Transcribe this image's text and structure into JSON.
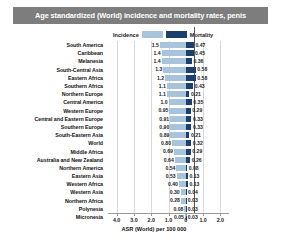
{
  "title": "Age standardized (World) incidence and mortality rates, penis",
  "legend": {
    "incidence_label": "Incidence",
    "mortality_label": "Mortality",
    "incidence_color": "#a8c4dd",
    "mortality_color": "#1c3f6e",
    "position": "top-center"
  },
  "axis": {
    "title": "ASR (World) per 100 000",
    "ticks": [
      "4.0",
      "3.0",
      "2.0",
      "1.0",
      "0",
      "1.0",
      "2.0"
    ],
    "tick_values": [
      -4.0,
      -3.0,
      -2.0,
      -1.0,
      0,
      1.0,
      2.0
    ]
  },
  "chart_data": {
    "type": "bar",
    "orientation": "horizontal-diverging",
    "title": "Age standardized (World) incidence and mortality rates, penis",
    "xlabel": "ASR (World) per 100 000",
    "ylabel": "",
    "xlim": [
      -4.5,
      2.5
    ],
    "grid": true,
    "legend_position": "top-center",
    "categories": [
      "South America",
      "Caribbean",
      "Melanesia",
      "South-Central Asia",
      "Eastern Africa",
      "Southern Africa",
      "Northern Europe",
      "Central America",
      "Western Europe",
      "Central and Eastern Europe",
      "Southern Europe",
      "South-Eastern Asia",
      "World",
      "Middle Africa",
      "Australia and New Zealand",
      "Northern America",
      "Eastern Asia",
      "Western Africa",
      "Western Asia",
      "Northern Africa",
      "Polynesia",
      "Micronesia"
    ],
    "series": [
      {
        "name": "Incidence",
        "color": "#a8c4dd",
        "direction": "left",
        "values": [
          1.5,
          1.4,
          1.4,
          1.3,
          1.2,
          1.1,
          1.1,
          1.0,
          0.95,
          0.91,
          0.9,
          0.89,
          0.8,
          0.69,
          0.64,
          0.54,
          0.53,
          0.4,
          0.3,
          0.28,
          0.08,
          0.05
        ]
      },
      {
        "name": "Mortality",
        "color": "#1c3f6e",
        "direction": "right",
        "values": [
          0.47,
          0.45,
          0.36,
          0.58,
          0.58,
          0.43,
          0.21,
          0.35,
          0.29,
          0.33,
          0.33,
          0.21,
          0.32,
          0.29,
          0.26,
          0.08,
          0.13,
          0.13,
          0.04,
          0.03,
          0.03,
          0.03
        ]
      }
    ],
    "labels": {
      "incidence": [
        "1.5",
        "1.4",
        "1.4",
        "1.3",
        "1.2",
        "1.1",
        "1.1",
        "1.0",
        "0.95",
        "0.91",
        "0.90",
        "0.89",
        "0.80",
        "0.69",
        "0.64",
        "0.54",
        "0.53",
        "0.40",
        "0.30",
        "0.28",
        "0.08",
        "0.05"
      ],
      "mortality": [
        "0.47",
        "0.45",
        "0.36",
        "0.58",
        "0.58",
        "0.43",
        "0.21",
        "0.35",
        "0.29",
        "0.33",
        "0.33",
        "0.21",
        "0.32",
        "0.29",
        "0.26",
        "0.08",
        "0.13",
        "0.13",
        "0.04",
        "0.03",
        "0.03",
        "0.03"
      ]
    }
  }
}
